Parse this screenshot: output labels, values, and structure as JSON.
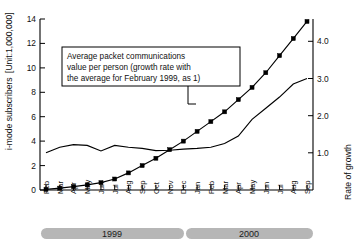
{
  "chart_data": {
    "type": "line",
    "title": "",
    "xlabel": "",
    "ylabel": "i-mode subscribers",
    "y_unit_label": "[Unit:1,000,000]",
    "y2label": "Rate of growth",
    "ylim": [
      0,
      14
    ],
    "y2lim": [
      0,
      4.6
    ],
    "yticks": [
      "0",
      "2",
      "4",
      "6",
      "8",
      "10",
      "12",
      "14"
    ],
    "ytick_values": [
      0,
      2,
      4,
      6,
      8,
      10,
      12,
      14
    ],
    "y2ticks": [
      "1.0",
      "2.0",
      "3.0",
      "4.0"
    ],
    "y2tick_values": [
      1.0,
      2.0,
      3.0,
      4.0
    ],
    "grid": false,
    "legend_position": "none",
    "categories": [
      "Feb",
      "Mar",
      "Apr",
      "May",
      "Jun",
      "Jul",
      "Aug",
      "Sep",
      "Oct",
      "Nov",
      "Dec",
      "Jan",
      "Feb",
      "Mar",
      "Apr",
      "May",
      "Jun",
      "Jul",
      "Aug",
      "Sep"
    ],
    "series": [
      {
        "name": "i-mode subscribers",
        "axis": "left",
        "markers": true,
        "values": [
          0.05,
          0.15,
          0.28,
          0.42,
          0.6,
          0.9,
          1.4,
          2.0,
          2.6,
          3.3,
          4.0,
          4.8,
          5.6,
          6.4,
          7.4,
          8.4,
          9.6,
          11.0,
          12.4,
          13.8
        ]
      },
      {
        "name": "Average packet communications value per person",
        "axis": "right",
        "markers": false,
        "values": [
          1.0,
          1.15,
          1.22,
          1.2,
          1.05,
          1.2,
          1.15,
          1.12,
          1.06,
          1.07,
          1.1,
          1.12,
          1.15,
          1.25,
          1.45,
          1.9,
          2.2,
          2.5,
          2.85,
          3.0
        ]
      }
    ],
    "annotation": {
      "lines": [
        "Average packet communications",
        "value per person (growth rate with",
        "the average for February 1999, as 1)"
      ],
      "points_to_month": "Dec"
    },
    "period_bars": [
      {
        "label": "1999",
        "start": "Feb",
        "end": "Dec"
      },
      {
        "label": "2000",
        "start": "Jan",
        "end": "Sep"
      }
    ],
    "colors": {
      "line": "#000000",
      "period_bar": "#b6b6b6",
      "background": "#ffffff"
    }
  }
}
